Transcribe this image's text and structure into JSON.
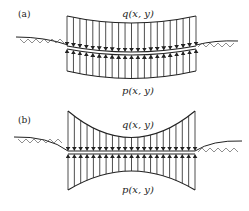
{
  "figure": {
    "panels": [
      {
        "id": "a",
        "label": "(a)",
        "top_load_label": "q(x, y)",
        "bottom_load_label": "p(x, y)",
        "description": "Beam on deformed ground: downward distributed load q on top, upward soil reaction p on bottom; both load profiles curved (sagging)."
      },
      {
        "id": "b",
        "label": "(b)",
        "top_load_label": "q(x, y)",
        "bottom_load_label": "p(x, y)",
        "description": "Straight beam spanning a trench: load q larger at ends, smaller at center; reaction p likewise larger at ends."
      }
    ],
    "colors": {
      "line": "#222222",
      "ground_hatch": "#333333",
      "background": "#ffffff"
    },
    "arrow_count_per_side": 20
  }
}
